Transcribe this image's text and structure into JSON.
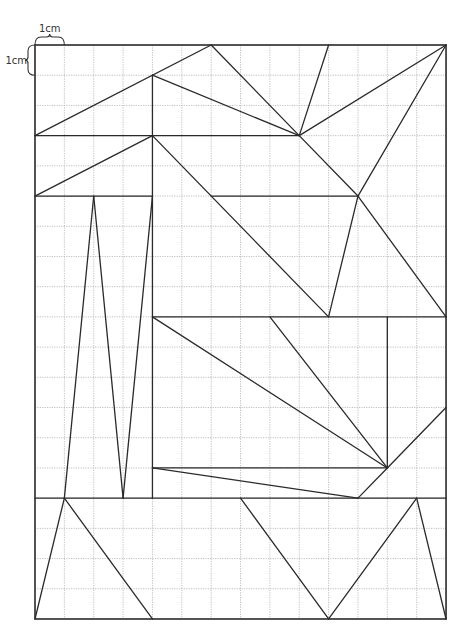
{
  "diagram": {
    "grid": {
      "cols": 14,
      "rows": 19,
      "origin_x": 35,
      "origin_y": 45,
      "cell_w": 29.36,
      "cell_h": 30.21,
      "grid_color": "#b8b8b8",
      "line_color": "#2a2a2a"
    },
    "scale_labels": {
      "horizontal": "1cm",
      "vertical": "1cm"
    },
    "segments": [
      [
        [
          0,
          3
        ],
        [
          6,
          0
        ]
      ],
      [
        [
          6,
          0
        ],
        [
          9,
          3
        ]
      ],
      [
        [
          4,
          1
        ],
        [
          9,
          3
        ]
      ],
      [
        [
          10,
          0
        ],
        [
          9,
          3
        ]
      ],
      [
        [
          14,
          0
        ],
        [
          9,
          3
        ]
      ],
      [
        [
          0,
          3
        ],
        [
          9,
          3
        ]
      ],
      [
        [
          4,
          1
        ],
        [
          4,
          15
        ]
      ],
      [
        [
          0,
          5
        ],
        [
          4,
          3
        ]
      ],
      [
        [
          4,
          3
        ],
        [
          10,
          9
        ]
      ],
      [
        [
          9,
          3
        ],
        [
          11,
          5
        ]
      ],
      [
        [
          11,
          5
        ],
        [
          14,
          0
        ]
      ],
      [
        [
          11,
          5
        ],
        [
          14,
          9
        ]
      ],
      [
        [
          11,
          5
        ],
        [
          10,
          9
        ]
      ],
      [
        [
          0,
          5
        ],
        [
          4,
          5
        ]
      ],
      [
        [
          6,
          5
        ],
        [
          11,
          5
        ]
      ],
      [
        [
          2,
          5
        ],
        [
          1,
          15
        ]
      ],
      [
        [
          2,
          5
        ],
        [
          3,
          15
        ]
      ],
      [
        [
          4,
          5
        ],
        [
          3,
          15
        ]
      ],
      [
        [
          4,
          9
        ],
        [
          14,
          9
        ]
      ],
      [
        [
          12,
          9
        ],
        [
          12,
          14
        ]
      ],
      [
        [
          4,
          9
        ],
        [
          12,
          14
        ]
      ],
      [
        [
          8,
          9
        ],
        [
          12,
          14
        ]
      ],
      [
        [
          12,
          14
        ],
        [
          14,
          12
        ]
      ],
      [
        [
          4,
          14
        ],
        [
          12,
          14
        ]
      ],
      [
        [
          4,
          14
        ],
        [
          11,
          15
        ]
      ],
      [
        [
          11,
          15
        ],
        [
          12,
          14
        ]
      ],
      [
        [
          0,
          15
        ],
        [
          14,
          15
        ]
      ],
      [
        [
          1,
          15
        ],
        [
          0,
          19
        ]
      ],
      [
        [
          1,
          15
        ],
        [
          4,
          19
        ]
      ],
      [
        [
          7,
          15
        ],
        [
          10,
          19
        ]
      ],
      [
        [
          10,
          19
        ],
        [
          13,
          15
        ]
      ],
      [
        [
          13,
          15
        ],
        [
          14,
          19
        ]
      ]
    ]
  }
}
